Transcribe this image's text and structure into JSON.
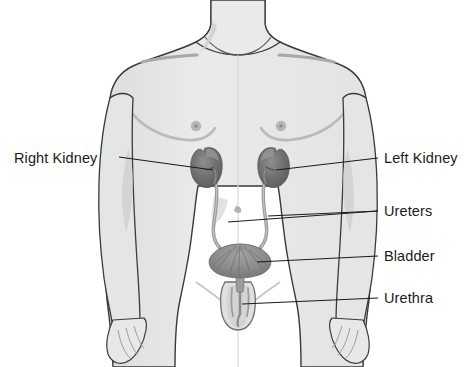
{
  "diagram": {
    "background_color": "#ffffff",
    "body_fill": "#e6e7e7",
    "body_outline": "#3a3a3a",
    "organ_dark": "#6e6e6e",
    "organ_mid": "#8d8d8d",
    "organ_light": "#b4b4b4",
    "leader_line_color": "#1b1b1b",
    "label_text_color": "#1b1b1b"
  },
  "labels": [
    {
      "id": "right-kidney",
      "text": "Right Kidney",
      "side": "left",
      "text_x": 14,
      "text_y": 151,
      "leader": {
        "x1": 119,
        "y1": 157,
        "x2": 213,
        "y2": 170
      }
    },
    {
      "id": "left-kidney",
      "text": "Left Kidney",
      "side": "right",
      "text_x": 384,
      "text_y": 151,
      "leader": {
        "x1": 378,
        "y1": 158,
        "x2": 276,
        "y2": 170
      }
    },
    {
      "id": "ureters",
      "text": "Ureters",
      "side": "right",
      "text_x": 384,
      "text_y": 204,
      "leader": {
        "x1": 378,
        "y1": 211,
        "x2": 228,
        "y2": 222
      },
      "leader2": {
        "x1": 378,
        "y1": 211,
        "x2": 268,
        "y2": 216
      }
    },
    {
      "id": "bladder",
      "text": "Bladder",
      "side": "right",
      "text_x": 384,
      "text_y": 249,
      "leader": {
        "x1": 378,
        "y1": 256,
        "x2": 257,
        "y2": 262
      }
    },
    {
      "id": "urethra",
      "text": "Urethra",
      "side": "right",
      "text_x": 384,
      "text_y": 291,
      "leader": {
        "x1": 378,
        "y1": 298,
        "x2": 242,
        "y2": 304
      }
    }
  ],
  "organs": [
    {
      "id": "right-kidney-organ",
      "name": "right kidney",
      "cx": 208,
      "cy": 170
    },
    {
      "id": "left-kidney-organ",
      "name": "left kidney",
      "cx": 272,
      "cy": 170
    },
    {
      "id": "right-ureter-organ",
      "name": "right ureter"
    },
    {
      "id": "left-ureter-organ",
      "name": "left ureter"
    },
    {
      "id": "bladder-organ",
      "name": "bladder",
      "cx": 240,
      "cy": 258
    },
    {
      "id": "urethra-organ",
      "name": "urethra",
      "cx": 240,
      "cy": 300
    }
  ],
  "body_parts": [
    {
      "id": "neck",
      "name": "neck"
    },
    {
      "id": "left-shoulder",
      "name": "left shoulder"
    },
    {
      "id": "right-shoulder",
      "name": "right shoulder"
    },
    {
      "id": "chest",
      "name": "chest"
    },
    {
      "id": "abdomen",
      "name": "abdomen"
    },
    {
      "id": "left-arm",
      "name": "left arm"
    },
    {
      "id": "right-arm",
      "name": "right arm"
    },
    {
      "id": "left-hand",
      "name": "left hand"
    },
    {
      "id": "right-hand",
      "name": "right hand"
    },
    {
      "id": "left-thigh",
      "name": "left thigh"
    },
    {
      "id": "right-thigh",
      "name": "right thigh"
    }
  ]
}
